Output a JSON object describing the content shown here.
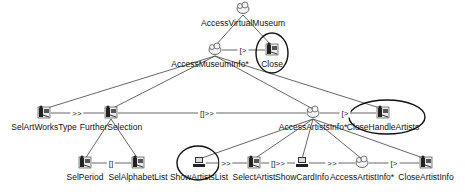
{
  "diagram": {
    "type": "ConcurTaskTrees task model",
    "nodes": [
      {
        "id": "root",
        "label": "AccessVirtualMuseum",
        "kind": "abstract",
        "x": 243,
        "y": 9,
        "lx": 243,
        "ly": 18
      },
      {
        "id": "ami",
        "label": "AccessMuseumInfo*",
        "kind": "abstract",
        "x": 215,
        "y": 50,
        "lx": 210,
        "ly": 59
      },
      {
        "id": "close",
        "label": "Close",
        "kind": "interaction",
        "x": 272,
        "y": 50,
        "lx": 272,
        "ly": 59,
        "circled": true
      },
      {
        "id": "sawt",
        "label": "SelArtWorksType",
        "kind": "interaction",
        "x": 44,
        "y": 113,
        "lx": 44,
        "ly": 122
      },
      {
        "id": "fs",
        "label": "FurtherSelection",
        "kind": "interaction",
        "x": 111,
        "y": 113,
        "lx": 111,
        "ly": 122
      },
      {
        "id": "aai",
        "label": "AccessArtistsInfo*",
        "kind": "abstract",
        "x": 313,
        "y": 113,
        "lx": 313,
        "ly": 122
      },
      {
        "id": "cha",
        "label": "CloseHandleArtists",
        "kind": "interaction",
        "x": 383,
        "y": 113,
        "lx": 383,
        "ly": 122,
        "circled": true
      },
      {
        "id": "sp",
        "label": "SelPeriod",
        "kind": "interaction",
        "x": 85,
        "y": 163,
        "lx": 85,
        "ly": 172
      },
      {
        "id": "sal",
        "label": "SelAlphabetList",
        "kind": "interaction",
        "x": 138,
        "y": 163,
        "lx": 138,
        "ly": 172
      },
      {
        "id": "sasl",
        "label": "ShowArtistsList",
        "kind": "application",
        "x": 199,
        "y": 163,
        "lx": 199,
        "ly": 172,
        "circled": true
      },
      {
        "id": "sa",
        "label": "SelectArtist",
        "kind": "interaction",
        "x": 254,
        "y": 163,
        "lx": 254,
        "ly": 172
      },
      {
        "id": "sci",
        "label": "ShowCardInfo",
        "kind": "application",
        "x": 302,
        "y": 163,
        "lx": 302,
        "ly": 172
      },
      {
        "id": "aaif",
        "label": "AccessArtistInfo*",
        "kind": "abstract",
        "x": 362,
        "y": 163,
        "lx": 362,
        "ly": 172
      },
      {
        "id": "cai",
        "label": "CloseArtistInfo",
        "kind": "interaction",
        "x": 426,
        "y": 163,
        "lx": 426,
        "ly": 172
      }
    ],
    "edges": [
      [
        "root",
        "ami"
      ],
      [
        "root",
        "close"
      ],
      [
        "ami",
        "sawt"
      ],
      [
        "ami",
        "fs"
      ],
      [
        "ami",
        "aai"
      ],
      [
        "ami",
        "cha"
      ],
      [
        "fs",
        "sp"
      ],
      [
        "fs",
        "sal"
      ],
      [
        "aai",
        "sasl"
      ],
      [
        "aai",
        "sa"
      ],
      [
        "aai",
        "sci"
      ],
      [
        "aai",
        "aaif"
      ],
      [
        "aai",
        "cai"
      ]
    ],
    "operators": [
      {
        "from": "ami",
        "to": "close",
        "label": "[>",
        "x": 243,
        "y": 50
      },
      {
        "from": "sawt",
        "to": "fs",
        "label": ">>",
        "x": 77,
        "y": 113
      },
      {
        "from": "fs",
        "to": "aai",
        "label": "[]>>",
        "x": 207,
        "y": 113
      },
      {
        "from": "aai",
        "to": "cha",
        "label": "[>",
        "x": 345,
        "y": 113
      },
      {
        "from": "sp",
        "to": "sal",
        "label": "[]",
        "x": 111,
        "y": 163
      },
      {
        "from": "sasl",
        "to": "sa",
        "label": ">>",
        "x": 226,
        "y": 163
      },
      {
        "from": "sa",
        "to": "sci",
        "label": "[]>>",
        "x": 278,
        "y": 163
      },
      {
        "from": "sci",
        "to": "aaif",
        "label": ">>",
        "x": 332,
        "y": 163
      },
      {
        "from": "aaif",
        "to": "cai",
        "label": "[>",
        "x": 394,
        "y": 163
      }
    ],
    "highlights": [
      {
        "node": "close",
        "cx": 272,
        "cy": 53,
        "rx": 16,
        "ry": 20
      },
      {
        "node": "cha",
        "cx": 387,
        "cy": 117,
        "rx": 38,
        "ry": 17
      },
      {
        "node": "sasl",
        "cx": 198,
        "cy": 163,
        "rx": 21,
        "ry": 17
      }
    ]
  }
}
